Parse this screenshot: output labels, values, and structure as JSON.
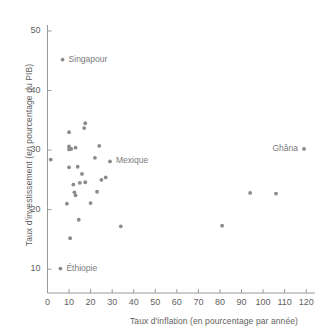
{
  "chart_data": {
    "type": "scatter",
    "title": "",
    "xlabel": "Taux d'inflation (en pourcentage par année)",
    "ylabel": "Taux d'investissement (en pourcentage du PIB)",
    "xlim": [
      0,
      122
    ],
    "ylim": [
      6,
      51
    ],
    "xticks": [
      0,
      10,
      20,
      30,
      40,
      50,
      60,
      70,
      80,
      90,
      100,
      110,
      120
    ],
    "yticks": [
      10,
      20,
      30,
      40,
      50
    ],
    "grid": false,
    "legend": "none",
    "marker_color": "#8a8a8a",
    "points": [
      {
        "x": 7,
        "y": 45.2,
        "label": "Singapour",
        "label_side": "right"
      },
      {
        "x": 1.5,
        "y": 28.4,
        "label": "",
        "label_side": ""
      },
      {
        "x": 6,
        "y": 10.1,
        "label": "Éthiopie",
        "label_side": "right"
      },
      {
        "x": 9,
        "y": 21.0,
        "label": "",
        "label_side": ""
      },
      {
        "x": 10,
        "y": 33.0,
        "label": "",
        "label_side": ""
      },
      {
        "x": 10,
        "y": 30.6,
        "label": "",
        "label_side": ""
      },
      {
        "x": 10,
        "y": 30.1,
        "label": "",
        "label_side": ""
      },
      {
        "x": 10,
        "y": 27.1,
        "label": "",
        "label_side": ""
      },
      {
        "x": 10.5,
        "y": 15.2,
        "label": "",
        "label_side": ""
      },
      {
        "x": 11,
        "y": 30.2,
        "label": "",
        "label_side": ""
      },
      {
        "x": 12,
        "y": 24.2,
        "label": "",
        "label_side": ""
      },
      {
        "x": 12.5,
        "y": 22.9,
        "label": "",
        "label_side": ""
      },
      {
        "x": 13,
        "y": 22.4,
        "label": "",
        "label_side": ""
      },
      {
        "x": 13,
        "y": 30.4,
        "label": "",
        "label_side": ""
      },
      {
        "x": 14,
        "y": 27.2,
        "label": "",
        "label_side": ""
      },
      {
        "x": 14.5,
        "y": 18.3,
        "label": "",
        "label_side": ""
      },
      {
        "x": 15,
        "y": 24.5,
        "label": "",
        "label_side": ""
      },
      {
        "x": 16,
        "y": 26.0,
        "label": "",
        "label_side": ""
      },
      {
        "x": 17,
        "y": 33.7,
        "label": "",
        "label_side": ""
      },
      {
        "x": 17.5,
        "y": 34.5,
        "label": "",
        "label_side": ""
      },
      {
        "x": 17.5,
        "y": 24.6,
        "label": "",
        "label_side": ""
      },
      {
        "x": 20,
        "y": 21.1,
        "label": "",
        "label_side": ""
      },
      {
        "x": 22,
        "y": 28.7,
        "label": "",
        "label_side": ""
      },
      {
        "x": 23,
        "y": 23.0,
        "label": "",
        "label_side": ""
      },
      {
        "x": 24,
        "y": 30.7,
        "label": "",
        "label_side": ""
      },
      {
        "x": 25,
        "y": 25.0,
        "label": "",
        "label_side": ""
      },
      {
        "x": 27,
        "y": 25.4,
        "label": "",
        "label_side": ""
      },
      {
        "x": 29,
        "y": 28.1,
        "label": "Mexique",
        "label_side": "right"
      },
      {
        "x": 34,
        "y": 17.2,
        "label": "",
        "label_side": ""
      },
      {
        "x": 81,
        "y": 17.3,
        "label": "",
        "label_side": ""
      },
      {
        "x": 94,
        "y": 22.8,
        "label": "",
        "label_side": ""
      },
      {
        "x": 106,
        "y": 22.7,
        "label": "",
        "label_side": ""
      },
      {
        "x": 119,
        "y": 30.2,
        "label": "Ghâna",
        "label_side": "left"
      }
    ]
  }
}
